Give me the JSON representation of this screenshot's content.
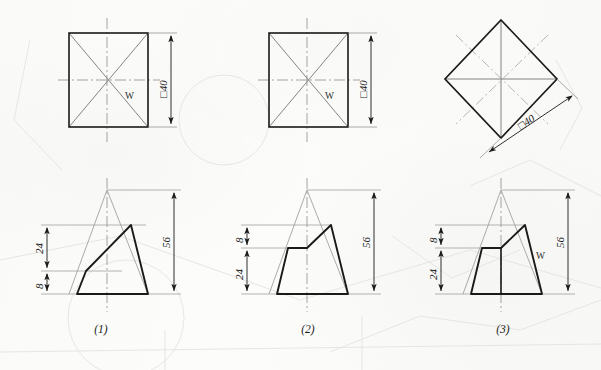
{
  "sheet": {
    "width": 601,
    "height": 370,
    "background_color": "#fbfbfa",
    "ink_color": "#1a1a1a",
    "thin_line_color": "#8d8d8d",
    "ghost_line_color": "#d9d9d6"
  },
  "drawing": {
    "title_captions": [
      "(1)",
      "(2)",
      "(3)"
    ],
    "top_views": [
      {
        "id": "top-view-1",
        "shape": "square",
        "dimension_label": "□40",
        "surface_label": "W",
        "has_diagonals": true,
        "has_centerlines": true
      },
      {
        "id": "top-view-2",
        "shape": "square",
        "dimension_label": "□40",
        "surface_label": "W",
        "has_diagonals": true,
        "has_centerlines": true
      },
      {
        "id": "top-view-3",
        "shape": "diamond",
        "dimension_label": "□40",
        "surface_label": "",
        "has_diagonals": true,
        "has_centerlines": true
      }
    ],
    "front_views": [
      {
        "id": "front-view-1",
        "caption": "(1)",
        "height_label": "56",
        "upper_label": "24",
        "lower_label": "8",
        "surface_label": "",
        "has_inner_vertical": false,
        "cut_type": "oblique-single-slope"
      },
      {
        "id": "front-view-2",
        "caption": "(2)",
        "height_label": "56",
        "upper_label": "8",
        "lower_label": "24",
        "surface_label": "",
        "has_inner_vertical": false,
        "cut_type": "flat-top-with-peak"
      },
      {
        "id": "front-view-3",
        "caption": "(3)",
        "height_label": "56",
        "upper_label": "8",
        "lower_label": "24",
        "surface_label": "W",
        "has_inner_vertical": true,
        "cut_type": "flat-top-with-peak"
      }
    ],
    "dimensions": {
      "square_size": "□40",
      "total_height": "56",
      "dim_24": "24",
      "dim_8": "8"
    }
  }
}
